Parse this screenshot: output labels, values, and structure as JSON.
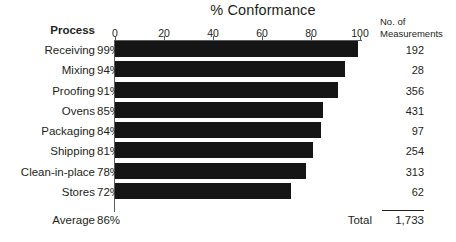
{
  "chart_data": {
    "type": "bar",
    "orientation": "horizontal",
    "title": "% Conformance",
    "xlabel": "",
    "ylabel": "Process",
    "xlim": [
      0,
      100
    ],
    "xticks": [
      0,
      20,
      40,
      60,
      80,
      100
    ],
    "xtick_labels": [
      "0",
      "20",
      "40",
      "60",
      "80",
      "100"
    ],
    "grid": false,
    "legend": null,
    "bar_color": "#151515",
    "categories": [
      "Receiving",
      "Mixing",
      "Proofing",
      "Ovens",
      "Packaging",
      "Shipping",
      "Clean-in-place",
      "Stores"
    ],
    "values": [
      99,
      94,
      91,
      85,
      84,
      81,
      78,
      72
    ],
    "value_labels": [
      "99%",
      "94%",
      "91%",
      "85%",
      "84%",
      "81%",
      "78%",
      "72%"
    ],
    "series": [
      {
        "name": "% Conformance",
        "values": [
          99,
          94,
          91,
          85,
          84,
          81,
          78,
          72
        ]
      },
      {
        "name": "No. of Measurements",
        "values": [
          192,
          28,
          356,
          431,
          97,
          254,
          313,
          62
        ]
      }
    ],
    "annotations": {
      "average_label": "Average",
      "average_value": "86%",
      "total_label": "Total",
      "total_value": "1,733"
    }
  },
  "headers": {
    "process": "Process",
    "measurements_line1": "No. of",
    "measurements_line2": "Measurements"
  },
  "rows": [
    {
      "process": "Receiving",
      "pct": "99%",
      "value": 99,
      "count": "192"
    },
    {
      "process": "Mixing",
      "pct": "94%",
      "value": 94,
      "count": "28"
    },
    {
      "process": "Proofing",
      "pct": "91%",
      "value": 91,
      "count": "356"
    },
    {
      "process": "Ovens",
      "pct": "85%",
      "value": 85,
      "count": "431"
    },
    {
      "process": "Packaging",
      "pct": "84%",
      "value": 84,
      "count": "97"
    },
    {
      "process": "Shipping",
      "pct": "81%",
      "value": 81,
      "count": "254"
    },
    {
      "process": "Clean-in-place",
      "pct": "78%",
      "value": 78,
      "count": "313"
    },
    {
      "process": "Stores",
      "pct": "72%",
      "value": 72,
      "count": "62"
    }
  ],
  "summary": {
    "average_label": "Average",
    "average_value": "86%",
    "total_label": "Total",
    "total_value": "1,733"
  },
  "axis": {
    "ticks": [
      "0",
      "20",
      "40",
      "60",
      "80",
      "100"
    ]
  },
  "colors": {
    "bar": "#151515",
    "axis": "#58595b",
    "text": "#231f20",
    "background": "#ffffff"
  }
}
